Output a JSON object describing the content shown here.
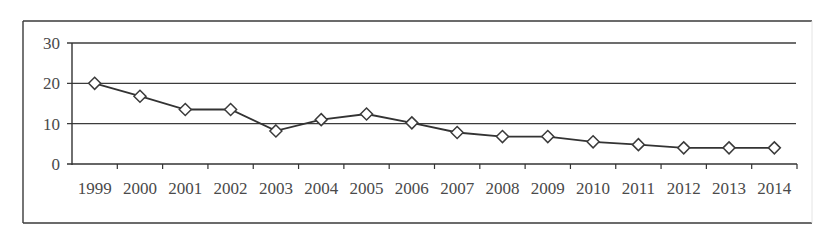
{
  "chart_data": {
    "type": "line",
    "title": "",
    "xlabel": "",
    "ylabel": "",
    "ylim": [
      0,
      30
    ],
    "yticks": [
      0,
      10,
      20,
      30
    ],
    "grid": true,
    "legend": null,
    "categories": [
      "1999",
      "2000",
      "2001",
      "2002",
      "2003",
      "2004",
      "2005",
      "2006",
      "2007",
      "2008",
      "2009",
      "2010",
      "2011",
      "2012",
      "2013",
      "2014"
    ],
    "series": [
      {
        "name": "",
        "marker": "diamond",
        "values": [
          20.0,
          16.8,
          13.5,
          13.5,
          8.2,
          11.0,
          12.4,
          10.2,
          7.8,
          6.8,
          6.8,
          5.5,
          4.8,
          4.0,
          4.0,
          4.0
        ]
      }
    ]
  },
  "style": {
    "frame_color": "#3a3a3a",
    "grid_color": "#3c3c3c",
    "axis_color": "#333333",
    "line_color": "#333333",
    "marker_fill": "#ffffff",
    "marker_stroke": "#3a3a3a",
    "text_color": "#4a4a4a"
  }
}
